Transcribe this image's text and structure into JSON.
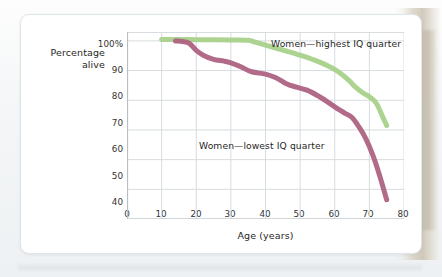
{
  "figure": {
    "y_axis_title_line1": "Percentage",
    "y_axis_title_line2": "alive",
    "x_axis_title": "Age (years)",
    "y_ticks": [
      "100%",
      "90",
      "80",
      "70",
      "60",
      "50",
      "40"
    ],
    "x_ticks": [
      "0",
      "10",
      "20",
      "30",
      "40",
      "50",
      "60",
      "70",
      "80"
    ],
    "label_high": "Women—highest IQ quarter",
    "label_low": "Women—lowest IQ quarter"
  },
  "colors": {
    "series_high": "#a8d189",
    "series_low": "#ad6382",
    "grid": "#d7dcdf",
    "axis": "#b8bfc4",
    "card_bg": "#ffffff",
    "card_border": "#dfe6ea",
    "page_bg": "#f6f7f8"
  },
  "chart_data": {
    "type": "line",
    "title": "",
    "subtitle": "",
    "xlabel": "Age (years)",
    "ylabel": "Percentage alive",
    "xlim": [
      0,
      80
    ],
    "ylim": [
      40,
      103
    ],
    "xticks": [
      0,
      10,
      20,
      30,
      40,
      50,
      60,
      70,
      80
    ],
    "yticks": [
      40,
      50,
      60,
      70,
      80,
      90,
      100
    ],
    "ytick_labels": [
      "40",
      "50",
      "60",
      "70",
      "80",
      "90",
      "100%"
    ],
    "grid": true,
    "legend": "inline-annotations",
    "series": [
      {
        "name": "Women—highest IQ quarter",
        "color": "#a8d189",
        "x": [
          10,
          15,
          20,
          25,
          30,
          35,
          37,
          40,
          43,
          46,
          50,
          54,
          58,
          61,
          64,
          66,
          68,
          70,
          72,
          74,
          75
        ],
        "values": [
          100.5,
          100.5,
          100.4,
          100.4,
          100.3,
          100.2,
          99.6,
          98.6,
          97.6,
          96.6,
          95.2,
          93.6,
          91.6,
          89.6,
          86.8,
          84.4,
          82.6,
          81.2,
          79.0,
          74.0,
          71.5
        ]
      },
      {
        "name": "Women—lowest IQ quarter",
        "color": "#ad6382",
        "x": [
          14,
          16,
          18,
          20,
          22,
          25,
          28,
          30,
          33,
          36,
          40,
          43,
          46,
          49,
          52,
          55,
          58,
          61,
          63,
          65,
          67,
          69,
          71,
          73,
          75
        ],
        "values": [
          100.0,
          99.8,
          99.2,
          96.8,
          95.2,
          93.8,
          93.2,
          92.6,
          91.2,
          89.6,
          88.8,
          87.6,
          85.6,
          84.4,
          83.4,
          81.6,
          79.4,
          77.0,
          75.6,
          74.2,
          71.0,
          67.0,
          61.5,
          54.5,
          46.5
        ]
      }
    ],
    "annotations": [
      {
        "text": "Women—highest IQ quarter",
        "x": 52,
        "y": 101
      },
      {
        "text": "Women—lowest IQ quarter",
        "x": 32,
        "y": 70.5
      }
    ]
  }
}
